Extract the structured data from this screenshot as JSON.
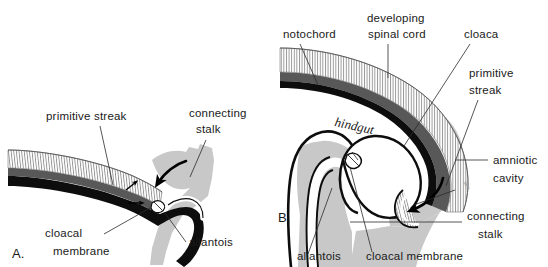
{
  "figure": {
    "background_color": "#ffffff",
    "width": 548,
    "height": 267
  },
  "colors": {
    "ink": "#1a1a1a",
    "outline": "#000000",
    "mesoderm_gray": "#c8c8c8",
    "dark_gray_band": "#585858",
    "black_band": "#0d0d0d",
    "hatch_line": "#777777",
    "leader_line": "#2b2b2b",
    "paper": "#ffffff"
  },
  "panels": [
    {
      "id": "A",
      "marker": "A.",
      "labels": [
        {
          "key": "primitive_streak",
          "text": "primitive streak",
          "x": 46,
          "y": 120
        },
        {
          "key": "connecting_stalk_line1",
          "text": "connecting",
          "x": 189,
          "y": 117
        },
        {
          "key": "connecting_stalk_line2",
          "text": "stalk",
          "x": 196,
          "y": 133
        },
        {
          "key": "cloacal_line1",
          "text": "cloacal",
          "x": 45,
          "y": 237
        },
        {
          "key": "cloacal_line2",
          "text": "membrane",
          "x": 53,
          "y": 255
        },
        {
          "key": "allantois",
          "text": "allantois",
          "x": 189,
          "y": 246
        }
      ]
    },
    {
      "id": "B",
      "marker": "B.",
      "labels": [
        {
          "key": "notochord",
          "text": "notochord",
          "x": 283,
          "y": 38
        },
        {
          "key": "developing",
          "text": "developing",
          "x": 367,
          "y": 22
        },
        {
          "key": "spinal_cord",
          "text": "spinal cord",
          "x": 368,
          "y": 38
        },
        {
          "key": "cloaca",
          "text": "cloaca",
          "x": 464,
          "y": 38
        },
        {
          "key": "primitive_b_line1",
          "text": "primitive",
          "x": 469,
          "y": 77
        },
        {
          "key": "primitive_b_line2",
          "text": "streak",
          "x": 469,
          "y": 94
        },
        {
          "key": "amniotic",
          "text": "amniotic",
          "x": 493,
          "y": 164
        },
        {
          "key": "cavity",
          "text": "cavity",
          "x": 493,
          "y": 182
        },
        {
          "key": "connecting_b1",
          "text": "connecting",
          "x": 467,
          "y": 220
        },
        {
          "key": "connecting_b2",
          "text": "stalk",
          "x": 478,
          "y": 238
        },
        {
          "key": "allantois_b",
          "text": "allantois",
          "x": 297,
          "y": 260
        },
        {
          "key": "cloacal_membrane_b",
          "text": "cloacal membrane",
          "x": 366,
          "y": 260
        },
        {
          "key": "hindgut",
          "text": "hindgut",
          "x": 334,
          "y": 126
        },
        {
          "key": "stalk_script",
          "text": "mes",
          "x": 463,
          "y": 182
        }
      ]
    }
  ],
  "structures": {
    "A": [
      {
        "name": "ectoderm-hatched-band",
        "description": "vertically hatched epiblast band"
      },
      {
        "name": "mesoderm-dark-band",
        "description": "dark gray layer beneath hatching"
      },
      {
        "name": "endoderm-black-band",
        "description": "black basal layer"
      },
      {
        "name": "connecting-stalk-mass",
        "description": "gray mesodermal connecting stalk"
      },
      {
        "name": "allantois-diverticulum",
        "description": "finger-like allantoic outpouching"
      },
      {
        "name": "cloacal-membrane-spot",
        "description": "small bilaminar membrane"
      },
      {
        "name": "migration-arrow-large",
        "description": "large curved arrow of cell migration"
      },
      {
        "name": "migration-arrow-small-up",
        "description": "small arrow pointing up-right"
      },
      {
        "name": "migration-arrow-small-right",
        "description": "small arrow pointing right"
      }
    ],
    "B": [
      {
        "name": "ectoderm-hatched-band",
        "description": "vertically hatched neural/surface band"
      },
      {
        "name": "mesoderm-dark-band",
        "description": "dark gray layer"
      },
      {
        "name": "notochord-black-line",
        "description": "black notochord stripe"
      },
      {
        "name": "hindgut-cavity",
        "description": "hindgut lumen"
      },
      {
        "name": "cloaca-cavity",
        "description": "expanded cloacal cavity"
      },
      {
        "name": "allantois-tube",
        "description": "allantoic tube descending in stalk"
      },
      {
        "name": "cloacal-membrane-spot",
        "description": "cloacal membrane"
      },
      {
        "name": "amniotic-cavity-space",
        "description": "amniotic cavity lumen"
      },
      {
        "name": "connecting-stalk-mass",
        "description": "gray connecting stalk body"
      },
      {
        "name": "migration-arrow",
        "description": "curved arrow within amniotic cavity"
      }
    ]
  }
}
